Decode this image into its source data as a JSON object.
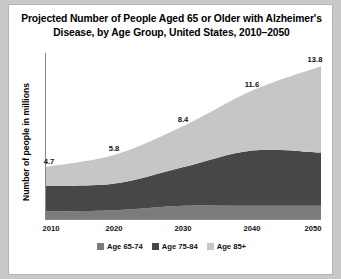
{
  "figure": {
    "background": "#ffffff",
    "page_background": "#c9c9c9",
    "border_color": "#b5b5b5"
  },
  "chart_data": {
    "type": "area",
    "stacked": true,
    "title": "Projected Number of People Aged 65 or Older with Alzheimer's Disease, by Age Group, United States, 2010–2050",
    "title_line1": "Projected Number of People Aged 65 or Older with Alzheimer's",
    "title_line2": "Disease, by  Age Group, United States, 2010–2050",
    "xlabel": "",
    "ylabel": "Number of people in millions",
    "categories": [
      2010,
      2020,
      2030,
      2040,
      2050
    ],
    "x": [
      2010,
      2020,
      2030,
      2040,
      2050
    ],
    "xlim": [
      2010,
      2050
    ],
    "ylim": [
      0,
      15
    ],
    "grid": false,
    "legend_position": "bottom",
    "series": [
      {
        "name": "Age 65-74",
        "color": "#7b7b7b",
        "values": [
          0.7,
          0.8,
          1.2,
          1.2,
          1.2
        ]
      },
      {
        "name": "Age 75-84",
        "color": "#474747",
        "values": [
          2.3,
          2.4,
          3.5,
          5.0,
          4.8
        ]
      },
      {
        "name": "Age 85+",
        "color": "#c6c6c6",
        "values": [
          1.7,
          2.6,
          3.7,
          5.4,
          7.8
        ]
      }
    ],
    "totals": [
      4.7,
      5.8,
      8.4,
      11.6,
      13.8
    ],
    "data_labels": [
      "4.7",
      "5.8",
      "8.4",
      "11.6",
      "13.8"
    ],
    "tick_labels": [
      "2010",
      "2020",
      "2030",
      "2040",
      "2050"
    ]
  },
  "legend": {
    "items": [
      {
        "label": "Age 65-74",
        "color": "#7b7b7b"
      },
      {
        "label": "Age 75-84",
        "color": "#474747"
      },
      {
        "label": "Age 85+",
        "color": "#c6c6c6"
      }
    ]
  }
}
